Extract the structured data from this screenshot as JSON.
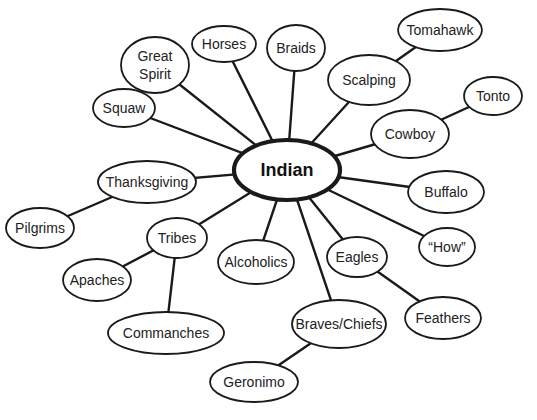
{
  "diagram": {
    "type": "concept-map",
    "center": {
      "id": "indian",
      "label": "Indian",
      "x": 287,
      "y": 170,
      "rx": 53,
      "ry": 30
    },
    "nodes": [
      {
        "id": "great-spirit",
        "lines": [
          "Great",
          "Spirit"
        ],
        "x": 155,
        "y": 65,
        "rx": 34,
        "ry": 28
      },
      {
        "id": "horses",
        "lines": [
          "Horses"
        ],
        "x": 224,
        "y": 44,
        "rx": 32,
        "ry": 18
      },
      {
        "id": "braids",
        "lines": [
          "Braids"
        ],
        "x": 296,
        "y": 48,
        "rx": 29,
        "ry": 23
      },
      {
        "id": "squaw",
        "lines": [
          "Squaw"
        ],
        "x": 124,
        "y": 108,
        "rx": 31,
        "ry": 19
      },
      {
        "id": "tomahawk",
        "lines": [
          "Tomahawk"
        ],
        "x": 440,
        "y": 30,
        "rx": 42,
        "ry": 21
      },
      {
        "id": "scalping",
        "lines": [
          "Scalping"
        ],
        "x": 369,
        "y": 80,
        "rx": 41,
        "ry": 25
      },
      {
        "id": "tonto",
        "lines": [
          "Tonto"
        ],
        "x": 493,
        "y": 96,
        "rx": 29,
        "ry": 19
      },
      {
        "id": "cowboy",
        "lines": [
          "Cowboy"
        ],
        "x": 410,
        "y": 134,
        "rx": 39,
        "ry": 24
      },
      {
        "id": "thanksgiving",
        "lines": [
          "Thanksgiving"
        ],
        "x": 147,
        "y": 182,
        "rx": 49,
        "ry": 21
      },
      {
        "id": "buffalo",
        "lines": [
          "Buffalo"
        ],
        "x": 446,
        "y": 192,
        "rx": 38,
        "ry": 21
      },
      {
        "id": "pilgrims",
        "lines": [
          "Pilgrims"
        ],
        "x": 40,
        "y": 228,
        "rx": 34,
        "ry": 20
      },
      {
        "id": "tribes",
        "lines": [
          "Tribes"
        ],
        "x": 177,
        "y": 238,
        "rx": 30,
        "ry": 20
      },
      {
        "id": "how",
        "lines": [
          "“How”"
        ],
        "x": 447,
        "y": 247,
        "rx": 28,
        "ry": 19
      },
      {
        "id": "alcoholics",
        "lines": [
          "Alcoholics"
        ],
        "x": 256,
        "y": 262,
        "rx": 38,
        "ry": 22
      },
      {
        "id": "eagles",
        "lines": [
          "Eagles"
        ],
        "x": 357,
        "y": 257,
        "rx": 30,
        "ry": 20
      },
      {
        "id": "apaches",
        "lines": [
          "Apaches"
        ],
        "x": 97,
        "y": 280,
        "rx": 34,
        "ry": 21
      },
      {
        "id": "feathers",
        "lines": [
          "Feathers"
        ],
        "x": 443,
        "y": 318,
        "rx": 38,
        "ry": 21
      },
      {
        "id": "commanches",
        "lines": [
          "Commanches"
        ],
        "x": 166,
        "y": 333,
        "rx": 58,
        "ry": 21
      },
      {
        "id": "braves-chiefs",
        "lines": [
          "Braves/Chiefs"
        ],
        "x": 339,
        "y": 324,
        "rx": 47,
        "ry": 24
      },
      {
        "id": "geronimo",
        "lines": [
          "Geronimo"
        ],
        "x": 254,
        "y": 382,
        "rx": 44,
        "ry": 20
      }
    ],
    "edges": [
      [
        "indian",
        "great-spirit"
      ],
      [
        "indian",
        "horses"
      ],
      [
        "indian",
        "braids"
      ],
      [
        "indian",
        "squaw"
      ],
      [
        "indian",
        "scalping"
      ],
      [
        "indian",
        "cowboy"
      ],
      [
        "indian",
        "thanksgiving"
      ],
      [
        "indian",
        "buffalo"
      ],
      [
        "indian",
        "tribes"
      ],
      [
        "indian",
        "how"
      ],
      [
        "indian",
        "alcoholics"
      ],
      [
        "indian",
        "eagles"
      ],
      [
        "indian",
        "braves-chiefs"
      ],
      [
        "scalping",
        "tomahawk"
      ],
      [
        "cowboy",
        "tonto"
      ],
      [
        "thanksgiving",
        "pilgrims"
      ],
      [
        "tribes",
        "apaches"
      ],
      [
        "tribes",
        "commanches"
      ],
      [
        "eagles",
        "feathers"
      ],
      [
        "braves-chiefs",
        "geronimo"
      ]
    ],
    "colors": {
      "stroke": "#1a1a1a",
      "text": "#222222",
      "background": "#ffffff"
    }
  }
}
